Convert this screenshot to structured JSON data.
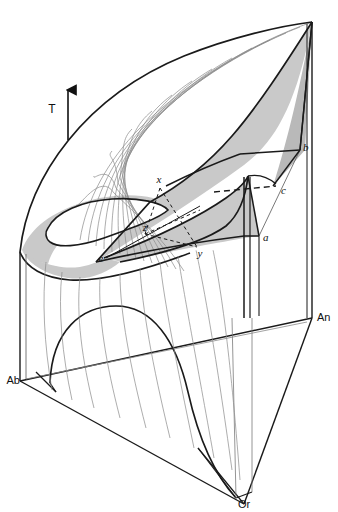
{
  "figure": {
    "kind": "ternary-phase-diagram",
    "background_color": "#ffffff",
    "line_color": "#1a1a1a",
    "thin_line_color": "#7a7a7a",
    "shade_color": "#c9c9c9",
    "shade_color_dark": "#b9b9b9"
  },
  "axis": {
    "temperature_label": "T",
    "temperature_direction": "up",
    "arrow_icon": "up-arrow-icon"
  },
  "corners": [
    {
      "id": "ab",
      "label": "Ab",
      "role": "albite-end-member",
      "x": 20,
      "y": 381
    },
    {
      "id": "an",
      "label": "An",
      "role": "anorthite-end-member",
      "x": 316,
      "y": 318
    },
    {
      "id": "or",
      "label": "Or",
      "role": "orthoclase-end-member",
      "x": 244,
      "y": 504
    }
  ],
  "points": [
    {
      "id": "a",
      "label": "a",
      "style": "italic",
      "x": 260,
      "y": 238
    },
    {
      "id": "b",
      "label": "b",
      "style": "italic",
      "x": 305,
      "y": 150
    },
    {
      "id": "c",
      "label": "c",
      "style": "italic",
      "x": 283,
      "y": 192
    },
    {
      "id": "e",
      "label": "e",
      "style": "italic",
      "x": 104,
      "y": 259
    },
    {
      "id": "x",
      "label": "x",
      "style": "italic",
      "x": 161,
      "y": 181
    },
    {
      "id": "y",
      "label": "y",
      "style": "italic",
      "x": 199,
      "y": 253
    },
    {
      "id": "z",
      "label": "z",
      "style": "italic",
      "x": 147,
      "y": 228
    }
  ],
  "features": {
    "liquidus_surface": "shaded",
    "solvus_dome": "front-face-arch",
    "two_liquid_loop": "white-ellipse",
    "tie_triangle": "dashed x-y-z",
    "contour_lines_count": 14,
    "dashed_line": "c-to-apex"
  }
}
